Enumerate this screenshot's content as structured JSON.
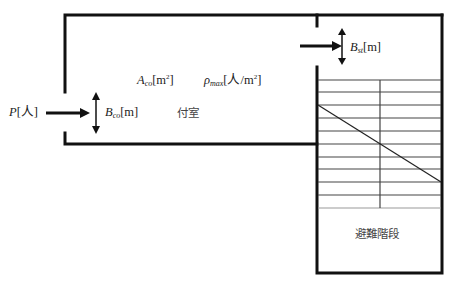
{
  "diagram": {
    "type": "floor-plan-evacuation",
    "labels": {
      "people_inflow": {
        "var": "P",
        "unit": "[人]"
      },
      "corridor_door_width": {
        "var": "B",
        "sub": "co",
        "unit": "[m]"
      },
      "corridor_area": {
        "var": "A",
        "sub": "co",
        "unit_pre": "[m",
        "unit_sup": "2",
        "unit_post": "]"
      },
      "max_density": {
        "var": "ρ",
        "sub": "max",
        "unit_pre": "[人/m",
        "unit_sup": "2",
        "unit_post": "]"
      },
      "stair_door_width": {
        "var": "B",
        "sub": "st",
        "unit": "[m]"
      },
      "antechamber": "付室",
      "evacuation_stair": "避難階段"
    },
    "colors": {
      "wall": "#111111",
      "stair_line": "#333333",
      "text": "#222222"
    },
    "stair": {
      "tread_count": 11
    }
  }
}
